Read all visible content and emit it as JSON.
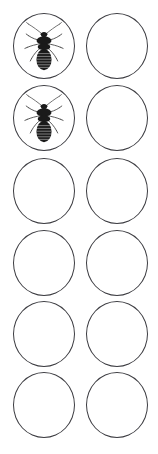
{
  "sheet": {
    "title": "Insect Specimen Circle Grid",
    "background_color": "#ffffff",
    "width_px": 158,
    "height_px": 454,
    "columns": 2,
    "rows": 6,
    "total_cells": 12,
    "filled_cells": 2,
    "empty_cells": 10
  },
  "circle": {
    "outline_color": "#3c3c41",
    "outline_width_px": 1,
    "fill_color": "#ffffff",
    "diameter_px": 62,
    "row_pitch_px": 72,
    "col_1_left_px": 13,
    "col_2_left_px": 86
  },
  "specimen": {
    "name": "bed-bug",
    "common_label": "Bed bug",
    "silhouette_color": "#1a1a1a",
    "leg_color": "#4a4a4a",
    "antenna_color": "#5a5a5a",
    "orientation": "dorsal-view-head-up",
    "abdomen_segments": 7,
    "leg_pairs": 3,
    "antenna_count": 2
  },
  "cells": [
    {
      "row": 1,
      "col": 1,
      "top_px": 13,
      "filled": true,
      "content": "bed-bug"
    },
    {
      "row": 1,
      "col": 2,
      "top_px": 13,
      "filled": false,
      "content": ""
    },
    {
      "row": 2,
      "col": 1,
      "top_px": 85,
      "filled": true,
      "content": "bed-bug"
    },
    {
      "row": 2,
      "col": 2,
      "top_px": 85,
      "filled": false,
      "content": ""
    },
    {
      "row": 3,
      "col": 1,
      "top_px": 158,
      "filled": false,
      "content": ""
    },
    {
      "row": 3,
      "col": 2,
      "top_px": 158,
      "filled": false,
      "content": ""
    },
    {
      "row": 4,
      "col": 1,
      "top_px": 230,
      "filled": false,
      "content": ""
    },
    {
      "row": 4,
      "col": 2,
      "top_px": 230,
      "filled": false,
      "content": ""
    },
    {
      "row": 5,
      "col": 1,
      "top_px": 301,
      "filled": false,
      "content": ""
    },
    {
      "row": 5,
      "col": 2,
      "top_px": 301,
      "filled": false,
      "content": ""
    },
    {
      "row": 6,
      "col": 1,
      "top_px": 372,
      "filled": false,
      "content": ""
    },
    {
      "row": 6,
      "col": 2,
      "top_px": 372,
      "filled": false,
      "content": ""
    }
  ]
}
